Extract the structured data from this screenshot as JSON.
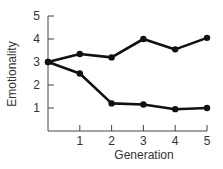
{
  "chart_data": {
    "type": "line",
    "title": "",
    "xlabel": "Generation",
    "ylabel": "Emotionality",
    "x": [
      0,
      1,
      2,
      3,
      4,
      5
    ],
    "x_tick_labels": [
      "1",
      "2",
      "3",
      "4",
      "5"
    ],
    "y_tick_labels": [
      "1",
      "2",
      "3",
      "4",
      "5"
    ],
    "xlim": [
      0,
      5
    ],
    "ylim": [
      0,
      5
    ],
    "grid": false,
    "legend": null,
    "series": [
      {
        "name": "upper line",
        "values": [
          3.0,
          3.35,
          3.2,
          4.0,
          3.55,
          4.05
        ]
      },
      {
        "name": "lower line",
        "values": [
          3.0,
          2.5,
          1.2,
          1.15,
          0.95,
          1.0
        ]
      }
    ],
    "colors": {
      "line": "#111111",
      "axis": "#444444",
      "text": "#333333"
    }
  }
}
